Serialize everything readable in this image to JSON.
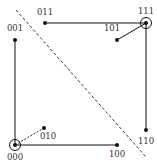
{
  "diagram": {
    "type": "hypercube-cut",
    "colors": {
      "stroke": "#111111",
      "label": "#333333",
      "background": "#ffffff"
    },
    "nodes": [
      {
        "id": "000",
        "label": "000",
        "circled": true
      },
      {
        "id": "001",
        "label": "001",
        "circled": false
      },
      {
        "id": "010",
        "label": "010",
        "circled": false
      },
      {
        "id": "011",
        "label": "011",
        "circled": false
      },
      {
        "id": "100",
        "label": "100",
        "circled": false
      },
      {
        "id": "101",
        "label": "101",
        "circled": false
      },
      {
        "id": "110",
        "label": "110",
        "circled": false
      },
      {
        "id": "111",
        "label": "111",
        "circled": true
      }
    ],
    "edges": [
      {
        "from": "000",
        "to": "001",
        "style": "solid"
      },
      {
        "from": "000",
        "to": "100",
        "style": "solid"
      },
      {
        "from": "000",
        "to": "010",
        "style": "dashed"
      },
      {
        "from": "011",
        "to": "111",
        "style": "solid"
      },
      {
        "from": "111",
        "to": "110",
        "style": "solid"
      },
      {
        "from": "111",
        "to": "101",
        "style": "solid"
      }
    ],
    "cut_line": {
      "style": "dashed",
      "description": "diagonal separating partition"
    }
  }
}
